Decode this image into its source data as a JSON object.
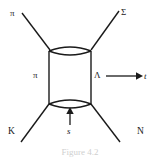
{
  "figure": {
    "caption": "Figure 4.2",
    "line_color": "#1a1a1a",
    "background": "#ffffff",
    "labels": {
      "incoming_meson": "π",
      "outgoing_baryon": "Σ",
      "internal_meson": "π",
      "internal_baryon": "Λ",
      "t_channel": "t",
      "s_channel": "s",
      "incoming_kaon": "K",
      "outgoing_nucleon": "N"
    },
    "arrows": [
      {
        "name": "t-channel-arrow",
        "direction": "right",
        "label": "t"
      },
      {
        "name": "s-channel-arrow",
        "direction": "up",
        "label": "s"
      }
    ]
  }
}
